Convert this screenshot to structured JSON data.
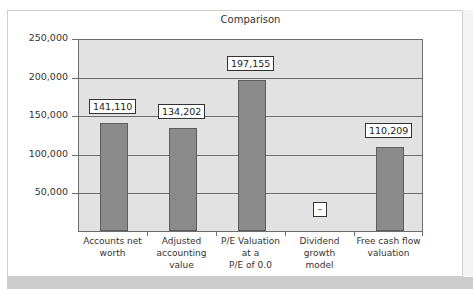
{
  "chart_data": {
    "type": "bar",
    "title": "Comparison",
    "xlabel": "",
    "ylabel": "",
    "categories": [
      "Accounts net worth",
      "Adjusted accounting value",
      "P/E Valuation at a P/E of 0.0",
      "Dividend growth model",
      "Free cash flow valuation"
    ],
    "values": [
      141110,
      134202,
      197155,
      0,
      110209
    ],
    "data_labels": [
      "141,110",
      "134,202",
      "197,155",
      "–",
      "110,209"
    ],
    "ylim": [
      0,
      250000
    ],
    "yticks": [
      50000,
      100000,
      150000,
      200000,
      250000
    ],
    "ytick_labels": [
      "50,000",
      "100,000",
      "150,000",
      "200,000",
      "250,000"
    ],
    "grid": true,
    "legend": null,
    "colors": {
      "bar": "#8a8a8a",
      "plot_bg": "#e2e2e2",
      "grid": "#6d6d6d"
    }
  },
  "x_label_lines": [
    [
      "Accounts net",
      "worth"
    ],
    [
      "Adjusted",
      "accounting value"
    ],
    [
      "P/E Valuation at a",
      "P/E of 0.0"
    ],
    [
      "Dividend growth",
      "model"
    ],
    [
      "Free cash flow",
      "valuation"
    ]
  ]
}
